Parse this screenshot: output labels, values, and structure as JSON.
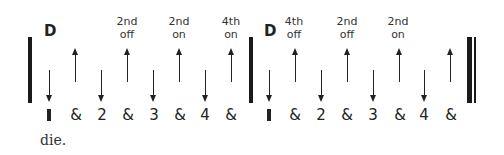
{
  "diagram": {
    "measure1": {
      "chord": "D",
      "annotations": [
        {
          "line1": "2nd",
          "line2": "off"
        },
        {
          "line1": "2nd",
          "line2": "on"
        },
        {
          "line1": "4th",
          "line2": "on"
        }
      ]
    },
    "measure2": {
      "chord": "D",
      "annotations": [
        {
          "line1": "4th",
          "line2": "off"
        },
        {
          "line1": "2nd",
          "line2": "off"
        },
        {
          "line1": "2nd",
          "line2": "on"
        }
      ]
    },
    "counts": [
      "&",
      "2",
      "&",
      "3",
      "&",
      "4",
      "&"
    ],
    "strum_pattern": [
      "down",
      "up",
      "down",
      "up",
      "down",
      "up",
      "down",
      "up"
    ]
  },
  "caption": "die."
}
